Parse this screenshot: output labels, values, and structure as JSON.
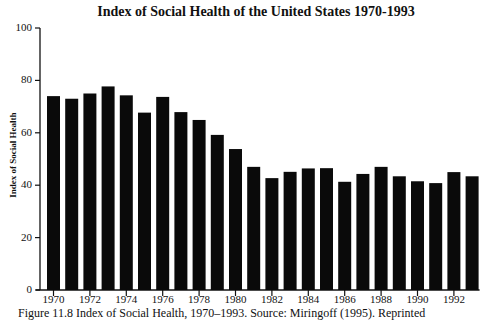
{
  "chart_data": {
    "type": "bar",
    "title": "Index of Social Health of the United States 1970-1993",
    "xlabel": "",
    "ylabel": "Index of Social Health",
    "ylim": [
      0,
      100
    ],
    "yticks": [
      0,
      20,
      40,
      60,
      80,
      100
    ],
    "xtick_labels": [
      "1970",
      "1972",
      "1974",
      "1976",
      "1978",
      "1980",
      "1982",
      "1984",
      "1986",
      "1988",
      "1990",
      "1992"
    ],
    "grid": false,
    "legend": null,
    "categories": [
      "1970",
      "1971",
      "1972",
      "1973",
      "1974",
      "1975",
      "1976",
      "1977",
      "1978",
      "1979",
      "1980",
      "1981",
      "1982",
      "1983",
      "1984",
      "1985",
      "1986",
      "1987",
      "1988",
      "1989",
      "1990",
      "1991",
      "1992",
      "1993"
    ],
    "values": [
      74,
      73,
      75,
      77.7,
      74.3,
      67.7,
      73.7,
      67.9,
      64.9,
      59.2,
      53.8,
      47,
      42.7,
      45.1,
      46.4,
      46.5,
      41.3,
      44.3,
      47,
      43.4,
      41.5,
      40.8,
      45,
      43.4
    ],
    "bar_color": "#0a0a0a"
  },
  "caption": "Figure 11.8   Index of Social Health, 1970–1993. Source: Miringoff (1995). Reprinted"
}
